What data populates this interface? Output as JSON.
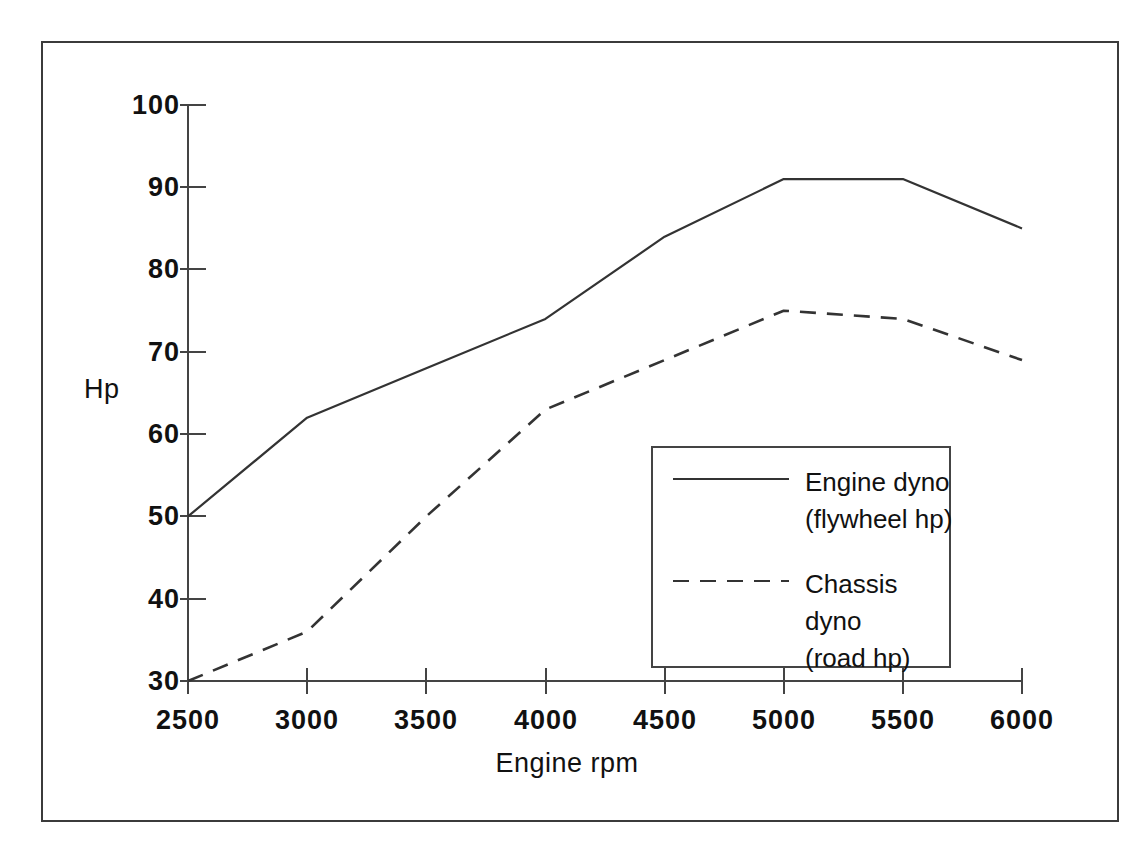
{
  "chart_data": {
    "type": "line",
    "title": "",
    "xlabel": "Engine rpm",
    "ylabel": "Hp",
    "x": [
      2500,
      3000,
      3500,
      4000,
      4500,
      5000,
      5500,
      6000
    ],
    "xlim": [
      2500,
      6000
    ],
    "ylim": [
      30,
      100
    ],
    "xticks": [
      "2500",
      "3000",
      "3500",
      "4000",
      "4500",
      "5000",
      "5500",
      "6000"
    ],
    "yticks": [
      "30",
      "40",
      "50",
      "60",
      "70",
      "80",
      "90",
      "100"
    ],
    "grid": false,
    "legend_position": "center-right-inside",
    "series": [
      {
        "name": "Engine dyno\n(flywheel hp)",
        "style": "solid",
        "color": "#333333",
        "values": [
          50,
          62,
          68,
          74,
          84,
          91,
          91,
          85
        ]
      },
      {
        "name": "Chassis dyno\n(road hp)",
        "style": "dashed",
        "color": "#333333",
        "values": [
          30,
          36,
          50,
          63,
          69,
          75,
          74,
          69
        ]
      }
    ]
  },
  "axes": {
    "y_title": "Hp",
    "x_title": "Engine rpm",
    "y_tick_labels": [
      "100",
      "90",
      "80",
      "70",
      "60",
      "50",
      "40",
      "30"
    ],
    "x_tick_labels": [
      "2500",
      "3000",
      "3500",
      "4000",
      "4500",
      "5000",
      "5500",
      "6000"
    ]
  },
  "legend": {
    "entries": [
      {
        "label": "Engine dyno\n(flywheel hp)",
        "style": "solid"
      },
      {
        "label": "Chassis dyno\n(road hp)",
        "style": "dashed"
      }
    ]
  },
  "colors": {
    "frame": "#3b3b3b",
    "axis": "#444444",
    "line": "#333333",
    "text": "#111111",
    "background": "#ffffff"
  }
}
